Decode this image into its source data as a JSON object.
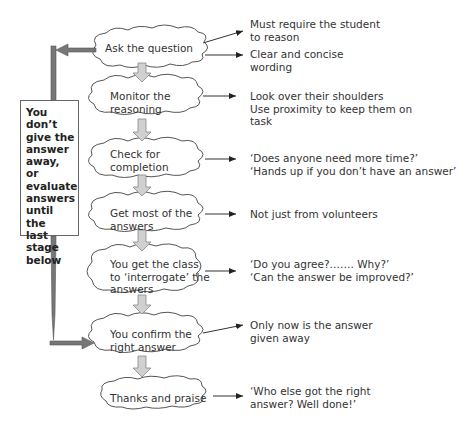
{
  "diagram": {
    "type": "flowchart",
    "stages": [
      {
        "id": "ask",
        "label": "Ask the question",
        "notes": "Must require the student\nto reason",
        "notes2": "Clear and concise\nwording"
      },
      {
        "id": "monitor",
        "label": "Monitor the\nreasoning",
        "notes": "Look over their shoulders\nUse proximity to keep them on\ntask"
      },
      {
        "id": "check",
        "label": "Check for\ncompletion",
        "notes": "‘Does anyone need more time?’\n‘Hands up if you don’t have an answer’"
      },
      {
        "id": "get",
        "label": "Get most of the\nanswers",
        "notes": "Not just from volunteers"
      },
      {
        "id": "interrogate",
        "label": "You get the class\nto ‘interrogate’ the\nanswers",
        "notes": "‘Do you agree?……. Why?’\n‘Can the answer be improved?’"
      },
      {
        "id": "confirm",
        "label": "You confirm the\nright answer",
        "notes": "Only now is the answer\ngiven away"
      },
      {
        "id": "thanks",
        "label": "Thanks and praise",
        "notes": "‘Who else got the right\nanswer?  Well done!’"
      }
    ],
    "side_note": "You don’t\ngive the\nanswer\naway, or\nevaluate\nanswers\nuntil the\nlast stage\nbelow",
    "colors": {
      "cloud_stroke": "#555555",
      "down_arrow_fill": "#d0d0d0",
      "side_bar": "#777777",
      "line": "#333333"
    }
  }
}
